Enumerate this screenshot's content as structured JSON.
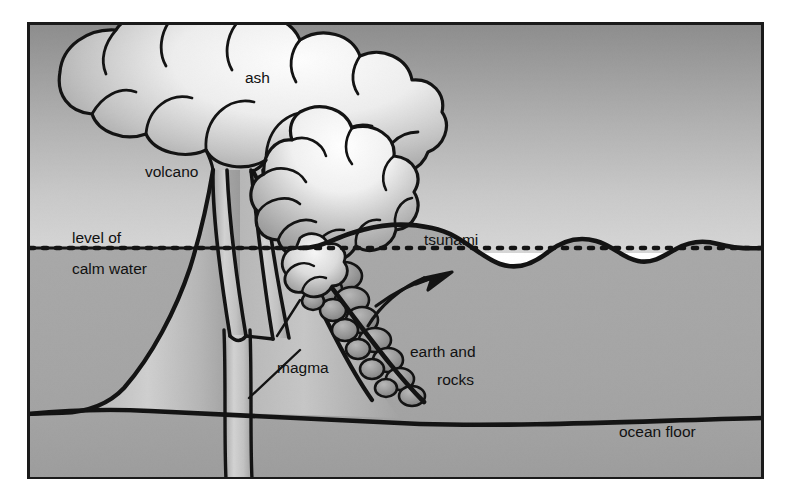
{
  "figure": {
    "frame": {
      "left": 27,
      "top": 22,
      "right": 764,
      "bottom": 479,
      "border_color": "#1a1a1a",
      "border_width": 3
    },
    "colors": {
      "page_background": "#ffffff",
      "sky_top": "#939393",
      "sky_bottom": "#cfcfcf",
      "water": "#a6a6a6",
      "seabed": "#a2a2a2",
      "volcano_rock": "#b0b0b0",
      "cloud_light": "#f4f4f4",
      "cloud_shadow": "#8e8e8e",
      "debris_rock": "#8f8f8f",
      "ink": "#111111",
      "label_text": "#111111"
    },
    "labels": [
      {
        "id": "ash",
        "text": "ash",
        "x": 245,
        "y": 83,
        "anchor": "start"
      },
      {
        "id": "volcano",
        "text": "volcano",
        "x": 145,
        "y": 177,
        "anchor": "start"
      },
      {
        "id": "level-of",
        "text": "level of",
        "x": 72,
        "y": 243,
        "anchor": "start"
      },
      {
        "id": "tsunami",
        "text": "tsunami",
        "x": 424,
        "y": 245,
        "anchor": "start"
      },
      {
        "id": "calm-water",
        "text": "calm water",
        "x": 72,
        "y": 274,
        "anchor": "start"
      },
      {
        "id": "magma",
        "text": "magma",
        "x": 277,
        "y": 373,
        "anchor": "start"
      },
      {
        "id": "earth-and",
        "text": "earth and",
        "x": 410,
        "y": 357,
        "anchor": "start"
      },
      {
        "id": "rocks",
        "text": "rocks",
        "x": 437,
        "y": 385,
        "anchor": "start"
      },
      {
        "id": "ocean-floor",
        "text": "ocean floor",
        "x": 619,
        "y": 437,
        "anchor": "start"
      }
    ],
    "features": {
      "water_level_y": 248,
      "ocean_floor_left_y": 412,
      "ocean_floor_right_y": 418,
      "volcano_summit_y": 168,
      "dotted_line_dash": "4 9",
      "wave_crest_height_px": 26,
      "wave_count": 4,
      "arrow_direction": "up-right",
      "arrow_from": [
        370,
        325
      ],
      "arrow_to": [
        455,
        272
      ]
    }
  }
}
